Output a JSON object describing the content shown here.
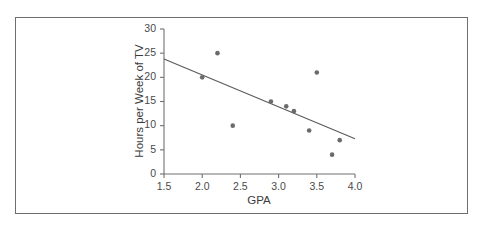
{
  "figure": {
    "background_color": "#ffffff",
    "border_color": "#6e6e6e",
    "axis_color": "#707070",
    "point_color": "#6b6b6b",
    "line_color": "#5a5a5a"
  },
  "chart_data": {
    "type": "scatter",
    "title": "",
    "xlabel": "GPA",
    "ylabel": "Hours per Week of TV",
    "xlim": [
      1.5,
      4.0
    ],
    "ylim": [
      0,
      30
    ],
    "xticks": [
      1.5,
      2.0,
      2.5,
      3.0,
      3.5,
      4.0
    ],
    "xtick_labels": [
      "1.5",
      "2.0",
      "2.5",
      "3.0",
      "3.5",
      "4.0"
    ],
    "yticks": [
      0,
      5,
      10,
      15,
      20,
      25,
      30
    ],
    "ytick_labels": [
      "0",
      "5",
      "10",
      "15",
      "20",
      "25",
      "30"
    ],
    "grid": false,
    "legend": null,
    "points": [
      {
        "x": 2.0,
        "y": 20
      },
      {
        "x": 2.2,
        "y": 25
      },
      {
        "x": 2.4,
        "y": 10
      },
      {
        "x": 2.9,
        "y": 15
      },
      {
        "x": 3.1,
        "y": 14
      },
      {
        "x": 3.2,
        "y": 13
      },
      {
        "x": 3.4,
        "y": 9
      },
      {
        "x": 3.5,
        "y": 21
      },
      {
        "x": 3.7,
        "y": 4
      },
      {
        "x": 3.8,
        "y": 7
      }
    ],
    "trend_line": {
      "type": "linear-regression",
      "x_start": 1.5,
      "y_start": 23.8,
      "x_end": 4.0,
      "y_end": 7.3
    }
  }
}
